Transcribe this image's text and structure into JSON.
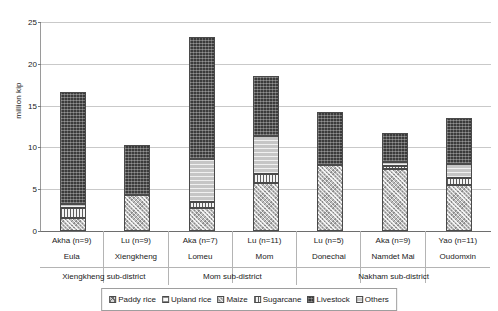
{
  "chart_data": {
    "type": "bar",
    "subtype": "stacked-bar",
    "title": "",
    "xlabel": "",
    "ylabel": "million kip",
    "ylim": [
      0,
      25
    ],
    "yticks": [
      0,
      5,
      10,
      15,
      20,
      25
    ],
    "grid": true,
    "legend_position": "bottom",
    "categories": [
      "Akha (n=9)",
      "Lu (n=9)",
      "Aka (n=7)",
      "Lu (n=11)",
      "Lu (n=5)",
      "Aka (n=9)",
      "Yao (n=11)"
    ],
    "villages": [
      "Eula",
      "Xiengkheng",
      "Lomeu",
      "Mom",
      "Donechai",
      "Namdet Mai",
      "Oudomxin"
    ],
    "groups": [
      {
        "label": "Xiengkheng sub-district",
        "span": 2
      },
      {
        "label": "Mom sub-district",
        "span": 2
      },
      {
        "label": "Nakham sub-district",
        "span": 3
      }
    ],
    "series": [
      {
        "name": "Paddy rice",
        "pattern": "paddy",
        "values": [
          0.0,
          0.0,
          0.0,
          0.0,
          0.0,
          0.0,
          0.0
        ]
      },
      {
        "name": "Upland rice",
        "pattern": "upland",
        "values": [
          0.0,
          0.0,
          0.0,
          0.0,
          0.0,
          0.0,
          0.0
        ]
      },
      {
        "name": "Maize",
        "pattern": "maize",
        "values": [
          1.6,
          4.3,
          2.7,
          5.7,
          7.9,
          7.4,
          5.5
        ]
      },
      {
        "name": "Sugarcane",
        "pattern": "sugarcane",
        "values": [
          1.2,
          0.0,
          0.8,
          1.1,
          0.0,
          0.4,
          0.9
        ]
      },
      {
        "name": "Livestock",
        "pattern": "livestock",
        "values": [
          13.4,
          6.0,
          14.6,
          7.1,
          6.3,
          3.4,
          5.5
        ]
      },
      {
        "name": "Others",
        "pattern": "others",
        "values": [
          0.4,
          0.0,
          5.1,
          4.6,
          0.0,
          0.5,
          1.6
        ]
      }
    ],
    "stack_order": [
      "Maize",
      "Sugarcane",
      "Others",
      "Livestock"
    ],
    "totals": [
      16.6,
      10.3,
      23.2,
      18.5,
      14.2,
      11.7,
      13.5
    ]
  },
  "legend": {
    "items": [
      {
        "label": "Paddy rice",
        "pattern": "paddy"
      },
      {
        "label": "Upland rice",
        "pattern": "upland"
      },
      {
        "label": "Maize",
        "pattern": "maize"
      },
      {
        "label": "Sugarcane",
        "pattern": "sugarcane"
      },
      {
        "label": "Livestock",
        "pattern": "livestock"
      },
      {
        "label": "Others",
        "pattern": "others"
      }
    ]
  }
}
